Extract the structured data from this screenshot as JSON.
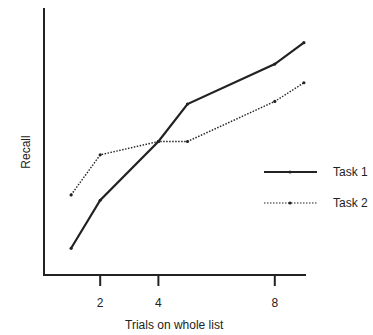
{
  "chart_data": {
    "type": "line",
    "title": "",
    "xlabel": "Trials on whole list",
    "ylabel": "Recall",
    "x_ticks": [
      2,
      4,
      8
    ],
    "xlim": [
      0,
      9.2
    ],
    "ylim": [
      0,
      100
    ],
    "y_ticks": [],
    "grid": false,
    "legend_position": "right-middle",
    "series": [
      {
        "name": "Task 1",
        "style": "solid",
        "x": [
          1,
          2,
          4,
          5,
          8,
          9
        ],
        "values": [
          10,
          28,
          50,
          64,
          79,
          87
        ]
      },
      {
        "name": "Task 2",
        "style": "dotted",
        "x": [
          1,
          2,
          4,
          5,
          8,
          9
        ],
        "values": [
          30,
          45,
          50,
          50,
          65,
          72
        ]
      }
    ]
  },
  "legend": {
    "items": [
      {
        "label": "Task 1"
      },
      {
        "label": "Task 2"
      }
    ]
  },
  "axes": {
    "x_tick_labels": [
      "2",
      "4",
      "8"
    ],
    "xlabel": "Trials on whole list",
    "ylabel": "Recall"
  }
}
